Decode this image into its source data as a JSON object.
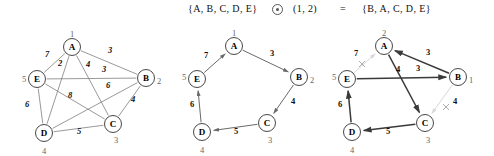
{
  "header": {
    "left_set": "{A, B, C, D, E}",
    "operator_icon": "circled-dot-operator",
    "operator_text": "⊙",
    "pair": "(1, 2)",
    "equals": "=",
    "right_set": "{B, A, C, D, E}"
  },
  "colors": {
    "node_stroke": "#333333",
    "edge": "#777777",
    "edge_bold": "#3a3a3a",
    "edge_removed": "#d8d8d8",
    "index_label": "#666666",
    "text": "#111111",
    "background": "#ffffff"
  },
  "graphs": [
    {
      "name": "complete-weighted-graph",
      "caption": "",
      "nodes": [
        {
          "id": "A",
          "label": "A",
          "index": "1",
          "x": 72,
          "y": 23,
          "index_dx": 0,
          "index_dy": -13
        },
        {
          "id": "B",
          "label": "B",
          "index": "2",
          "x": 146,
          "y": 54,
          "index_dx": 13,
          "index_dy": 3
        },
        {
          "id": "C",
          "label": "C",
          "index": "3",
          "x": 113,
          "y": 100,
          "index_dx": 3,
          "index_dy": 16
        },
        {
          "id": "D",
          "label": "D",
          "index": "4",
          "x": 44,
          "y": 109,
          "index_dx": 0,
          "index_dy": 18
        },
        {
          "id": "E",
          "label": "E",
          "index": "5",
          "x": 37,
          "y": 55,
          "index_dx": -13,
          "index_dy": 0
        }
      ],
      "edges": [
        {
          "from": "A",
          "to": "E",
          "weight": "7",
          "lx": 47,
          "ly": 33,
          "style": "thin"
        },
        {
          "from": "A",
          "to": "B",
          "weight": "3",
          "lx": 110,
          "ly": 29,
          "style": "thin"
        },
        {
          "from": "A",
          "to": "D",
          "weight": "2",
          "lx": 60,
          "ly": 42,
          "style": "thin"
        },
        {
          "from": "A",
          "to": "C",
          "weight": "4",
          "lx": 88,
          "ly": 43,
          "style": "thin"
        },
        {
          "from": "E",
          "to": "B",
          "weight": "3",
          "lx": 104,
          "ly": 48,
          "style": "thin"
        },
        {
          "from": "B",
          "to": "D",
          "weight": "6",
          "lx": 108,
          "ly": 64,
          "style": "thin"
        },
        {
          "from": "B",
          "to": "C",
          "weight": "4",
          "lx": 133,
          "ly": 78,
          "style": "thin"
        },
        {
          "from": "E",
          "to": "C",
          "weight": "8",
          "lx": 70,
          "ly": 74,
          "style": "thin"
        },
        {
          "from": "E",
          "to": "D",
          "weight": "6",
          "lx": 27,
          "ly": 83,
          "style": "thin"
        },
        {
          "from": "D",
          "to": "C",
          "weight": "5",
          "lx": 79,
          "ly": 110,
          "style": "thin"
        }
      ]
    },
    {
      "name": "hamiltonian-cycle-graph",
      "caption": "",
      "nodes": [
        {
          "id": "A",
          "label": "A",
          "index": "1",
          "x": 66,
          "y": 22,
          "index_dx": 0,
          "index_dy": -13
        },
        {
          "id": "B",
          "label": "B",
          "index": "2",
          "x": 131,
          "y": 53,
          "index_dx": 13,
          "index_dy": 3
        },
        {
          "id": "C",
          "label": "C",
          "index": "3",
          "x": 99,
          "y": 99,
          "index_dx": 3,
          "index_dy": 17
        },
        {
          "id": "D",
          "label": "D",
          "index": "4",
          "x": 34,
          "y": 108,
          "index_dx": 0,
          "index_dy": 18
        },
        {
          "id": "E",
          "label": "E",
          "index": "5",
          "x": 29,
          "y": 55,
          "index_dx": -13,
          "index_dy": -2
        }
      ],
      "edges": [
        {
          "from": "E",
          "to": "A",
          "weight": "7",
          "lx": 38,
          "ly": 34,
          "style": "dir"
        },
        {
          "from": "A",
          "to": "B",
          "weight": "3",
          "lx": 104,
          "ly": 32,
          "style": "dir"
        },
        {
          "from": "B",
          "to": "C",
          "weight": "4",
          "lx": 125,
          "ly": 80,
          "style": "dir"
        },
        {
          "from": "C",
          "to": "D",
          "weight": "5",
          "lx": 68,
          "ly": 110,
          "style": "dir"
        },
        {
          "from": "D",
          "to": "E",
          "weight": "6",
          "lx": 24,
          "ly": 83,
          "style": "dir"
        }
      ]
    },
    {
      "name": "swapped-cycle-graph",
      "caption": "",
      "nodes": [
        {
          "id": "A",
          "label": "A",
          "index": "2",
          "x": 56,
          "y": 22,
          "index_dx": 0,
          "index_dy": -13
        },
        {
          "id": "B",
          "label": "B",
          "index": "1",
          "x": 130,
          "y": 53,
          "index_dx": 13,
          "index_dy": 3
        },
        {
          "id": "C",
          "label": "C",
          "index": "3",
          "x": 97,
          "y": 99,
          "index_dx": 3,
          "index_dy": 17
        },
        {
          "id": "D",
          "label": "D",
          "index": "4",
          "x": 24,
          "y": 108,
          "index_dx": 0,
          "index_dy": 18
        },
        {
          "id": "E",
          "label": "E",
          "index": "5",
          "x": 19,
          "y": 55,
          "index_dx": -13,
          "index_dy": -2
        }
      ],
      "edges": [
        {
          "from": "E",
          "to": "A",
          "weight": "7",
          "lx": 28,
          "ly": 32,
          "style": "removed"
        },
        {
          "from": "B",
          "to": "A",
          "weight": "3",
          "lx": 100,
          "ly": 31,
          "style": "bold"
        },
        {
          "from": "A",
          "to": "C",
          "weight": "4",
          "lx": 70,
          "ly": 48,
          "style": "bold"
        },
        {
          "from": "E",
          "to": "B",
          "weight": "3",
          "lx": 90,
          "ly": 47,
          "style": "bold"
        },
        {
          "from": "B",
          "to": "C",
          "weight": "4",
          "lx": 127,
          "ly": 80,
          "style": "removed"
        },
        {
          "from": "C",
          "to": "D",
          "weight": "5",
          "lx": 60,
          "ly": 110,
          "style": "bold"
        },
        {
          "from": "D",
          "to": "E",
          "weight": "6",
          "lx": 12,
          "ly": 83,
          "style": "bold"
        }
      ],
      "removed_marks": [
        {
          "name": "cross-mark-edge-7",
          "x": 34,
          "y": 40
        },
        {
          "name": "cross-mark-edge-4",
          "x": 118,
          "y": 83
        }
      ]
    }
  ]
}
